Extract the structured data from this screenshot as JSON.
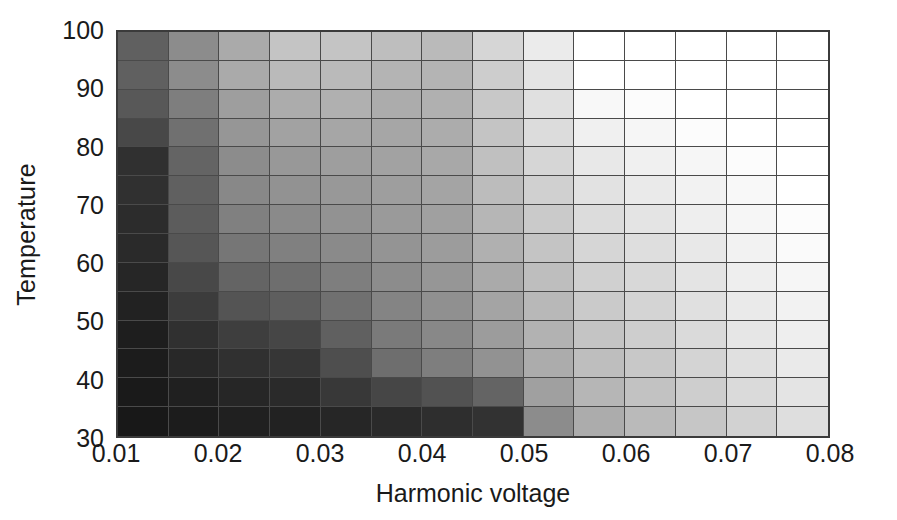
{
  "chart_data": {
    "type": "heatmap",
    "title": "",
    "xlabel": "Harmonic voltage",
    "ylabel": "Temperature",
    "xlim": [
      0.01,
      0.08
    ],
    "ylim": [
      30,
      100
    ],
    "grid": true,
    "legend": "none",
    "colormap": "grayscale (dark = low value, white = high value)",
    "x_tick_labels": [
      "0.01",
      "0.02",
      "0.03",
      "0.04",
      "0.05",
      "0.06",
      "0.07",
      "0.08"
    ],
    "x_tick_values": [
      0.01,
      0.02,
      0.03,
      0.04,
      0.05,
      0.06,
      0.07,
      0.08
    ],
    "y_tick_labels": [
      "100",
      "90",
      "80",
      "70",
      "60",
      "50",
      "40",
      "30"
    ],
    "y_tick_values": [
      100,
      90,
      80,
      70,
      60,
      50,
      40,
      30
    ],
    "x_cell_edges": [
      0.01,
      0.015,
      0.02,
      0.025,
      0.03,
      0.035,
      0.04,
      0.045,
      0.05,
      0.055,
      0.06,
      0.065,
      0.07,
      0.075,
      0.08
    ],
    "y_cell_edges": [
      100,
      97.5,
      95,
      92.5,
      90,
      87.5,
      85,
      82.5,
      80,
      77.5,
      75,
      72.5,
      70,
      67.5,
      65
    ],
    "x_cell_centers": [
      0.0125,
      0.0175,
      0.0225,
      0.0275,
      0.0325,
      0.0375,
      0.0425,
      0.0475,
      0.0525,
      0.0575,
      0.0625,
      0.0675,
      0.0725,
      0.0775
    ],
    "y_cell_centers": [
      98.75,
      96.25,
      93.75,
      91.25,
      88.75,
      86.25,
      83.75,
      81.25,
      78.75,
      76.25,
      73.75,
      71.25,
      68.75,
      66.25
    ],
    "n_rows": 14,
    "n_cols": 14,
    "value_range": [
      0,
      255
    ],
    "value_units": "grayscale level",
    "row_order": "top row = highest temperature (100), bottom row = lowest temperature (30)",
    "values": [
      [
        96,
        140,
        170,
        196,
        196,
        190,
        186,
        214,
        235,
        255,
        255,
        255,
        255,
        255
      ],
      [
        96,
        140,
        170,
        186,
        186,
        180,
        180,
        205,
        228,
        255,
        255,
        255,
        255,
        255
      ],
      [
        88,
        126,
        158,
        172,
        176,
        172,
        176,
        200,
        224,
        248,
        252,
        255,
        255,
        255
      ],
      [
        72,
        112,
        150,
        162,
        166,
        166,
        172,
        196,
        220,
        240,
        246,
        252,
        255,
        255
      ],
      [
        48,
        100,
        140,
        152,
        158,
        162,
        168,
        192,
        214,
        232,
        240,
        246,
        252,
        255
      ],
      [
        48,
        96,
        136,
        146,
        152,
        158,
        164,
        188,
        208,
        226,
        234,
        242,
        248,
        255
      ],
      [
        44,
        92,
        128,
        138,
        146,
        154,
        160,
        182,
        202,
        220,
        228,
        238,
        246,
        252
      ],
      [
        42,
        86,
        118,
        128,
        138,
        148,
        156,
        176,
        196,
        214,
        222,
        232,
        242,
        250
      ],
      [
        38,
        72,
        100,
        110,
        126,
        140,
        150,
        170,
        190,
        208,
        216,
        228,
        238,
        246
      ],
      [
        34,
        60,
        84,
        94,
        112,
        132,
        144,
        164,
        184,
        202,
        212,
        224,
        234,
        242
      ],
      [
        30,
        48,
        62,
        70,
        96,
        122,
        136,
        156,
        178,
        196,
        206,
        218,
        230,
        238
      ],
      [
        28,
        40,
        48,
        54,
        78,
        110,
        126,
        146,
        172,
        190,
        200,
        212,
        224,
        234
      ],
      [
        26,
        32,
        38,
        42,
        56,
        70,
        82,
        100,
        160,
        182,
        194,
        206,
        218,
        228
      ],
      [
        24,
        28,
        32,
        34,
        38,
        42,
        46,
        50,
        140,
        172,
        186,
        198,
        210,
        222
      ]
    ]
  }
}
